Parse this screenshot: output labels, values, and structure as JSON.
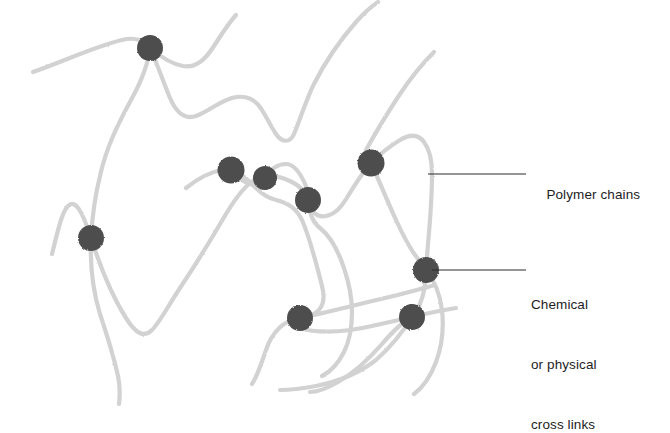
{
  "figure": {
    "background_color": "#ffffff"
  },
  "style": {
    "chain_color": "#d2d2d2",
    "chain_color_dark": "#c2c2c2",
    "node_color": "#4d4d4d",
    "node_color_dark": "#3a3a3a",
    "leader_color": "#2b2b2b",
    "text_color": "#1d1d1d",
    "chain_width": 4.2,
    "node_radius": 12.5,
    "leader_width": 1
  },
  "labels": {
    "polymer_chains": {
      "text": "Polymer chains",
      "x": 531,
      "y": 165,
      "leader": {
        "x1": 428,
        "y1": 174,
        "x2": 526,
        "y2": 174
      }
    },
    "cross_links": {
      "line1": "Chemical",
      "line2": "or physical",
      "line3": "cross links",
      "x": 531,
      "y": 255,
      "leader": {
        "x1": 432,
        "y1": 270,
        "x2": 526,
        "y2": 270
      }
    }
  },
  "diagram_data": {
    "type": "network-schematic",
    "node_count": 8,
    "chain_count": 7,
    "nodes": [
      {
        "id": "n1",
        "label": "cross-link",
        "cx": 150,
        "cy": 48,
        "r": 13
      },
      {
        "id": "n2",
        "label": "cross-link",
        "cx": 91,
        "cy": 238,
        "r": 13
      },
      {
        "id": "n3",
        "label": "cross-link",
        "cx": 231,
        "cy": 170,
        "r": 13.5
      },
      {
        "id": "n4",
        "label": "cross-link",
        "cx": 265,
        "cy": 178,
        "r": 12
      },
      {
        "id": "n5",
        "label": "cross-link",
        "cx": 308,
        "cy": 200,
        "r": 13
      },
      {
        "id": "n6",
        "label": "cross-link",
        "cx": 371,
        "cy": 163,
        "r": 13.5
      },
      {
        "id": "n7",
        "label": "cross-link",
        "cx": 426,
        "cy": 270,
        "r": 13
      },
      {
        "id": "n8",
        "label": "cross-link",
        "cx": 300,
        "cy": 318,
        "r": 13
      },
      {
        "id": "n9",
        "label": "cross-link",
        "cx": 412,
        "cy": 317,
        "r": 13
      }
    ],
    "chains": [
      {
        "id": "c1",
        "label": "polymer chain 1",
        "d": "M 33 72 C 62 62, 96 46, 122 40 C 138 36, 144 42, 152 49 C 162 58, 172 64, 183 66 C 196 68, 205 60, 214 46 C 221 35, 228 24, 236 15"
      },
      {
        "id": "c2",
        "label": "polymer chain 2",
        "d": "M 150 48 C 148 66, 141 82, 131 100 C 118 124, 106 148, 100 176 C 94 200, 92 220, 91 238 C 90 262, 92 288, 100 314 C 108 338, 114 358, 118 376 C 120 386, 120 396, 119 404"
      },
      {
        "id": "c3",
        "label": "polymer chain 3",
        "d": "M 151 50 C 158 66, 164 84, 170 98 C 176 112, 184 120, 196 116 C 208 112, 218 102, 232 98 C 246 94, 256 100, 262 110 C 268 120, 272 128, 276 134 C 282 143, 290 143, 294 134 C 300 120, 306 100, 314 84 C 326 60, 342 38, 356 22 C 364 13, 372 6, 378 2"
      },
      {
        "id": "c4",
        "label": "polymer chain 4",
        "d": "M 52 254 C 58 230, 62 212, 68 206 C 75 199, 82 210, 91 238 C 100 266, 112 296, 126 318 C 136 334, 144 338, 152 330 C 160 322, 168 306, 180 288 C 196 264, 212 238, 226 214 C 238 194, 248 182, 258 178 C 268 174, 280 176, 292 182 C 302 187, 306 194, 308 200 C 312 212, 316 218, 326 216 C 336 214, 342 206, 348 196 C 358 180, 364 170, 371 163 C 380 154, 390 146, 400 140 C 410 134, 418 134, 424 142 C 430 150, 432 160, 432 174 C 432 196, 430 222, 428 244 C 427 258, 426 266, 426 270 C 426 282, 424 294, 420 304 C 416 312, 414 316, 412 317 C 404 321, 394 330, 382 344 C 368 360, 352 374, 338 382 C 326 389, 316 392, 310 392"
      },
      {
        "id": "c5",
        "label": "polymer chain 5",
        "d": "M 186 188 C 196 180, 210 172, 222 170 C 228 169, 231 170, 231 170 C 240 172, 248 180, 256 188 C 262 194, 268 198, 276 200 C 288 203, 296 208, 302 220 C 310 238, 316 262, 322 286 C 328 308, 316 316, 300 318 C 284 320, 272 332, 266 350 C 260 368, 256 378, 252 384"
      },
      {
        "id": "c6",
        "label": "polymer chain 6",
        "d": "M 231 170 C 240 180, 250 186, 258 184 C 262 183, 264 180, 265 178 C 270 170, 276 164, 286 164 C 294 164, 300 172, 306 186 C 308 194, 308 198, 308 200 C 309 212, 312 222, 320 228 C 330 236, 338 250, 344 268 C 350 286, 352 300, 352 312 C 352 326, 350 340, 344 352 C 338 364, 330 372, 322 376"
      },
      {
        "id": "c7",
        "label": "polymer chain 7",
        "d": "M 371 163 C 378 178, 386 198, 396 220 C 406 242, 416 258, 424 266 C 425 268, 426 269, 426 270 C 434 280, 440 294, 442 310 C 444 328, 442 346, 436 362 C 430 378, 422 388, 414 394"
      },
      {
        "id": "c8",
        "label": "polymer chain 8",
        "d": "M 366 150 C 376 132, 388 112, 400 94 C 412 76, 424 62, 434 52"
      },
      {
        "id": "c9",
        "label": "polymer chain 9",
        "d": "M 300 318 C 320 314, 344 308, 368 302 C 390 297, 410 292, 424 288 C 428 287, 430 286, 432 286"
      },
      {
        "id": "c10",
        "label": "polymer chain 10",
        "d": "M 298 328 C 320 334, 346 332, 372 326 C 394 321, 408 318, 412 317 C 428 313, 444 310, 456 308"
      },
      {
        "id": "c11",
        "label": "polymer chain 11",
        "d": "M 412 317 C 404 330, 392 346, 376 360 C 358 374, 336 382, 316 386 C 300 389, 288 390, 280 390"
      }
    ]
  }
}
